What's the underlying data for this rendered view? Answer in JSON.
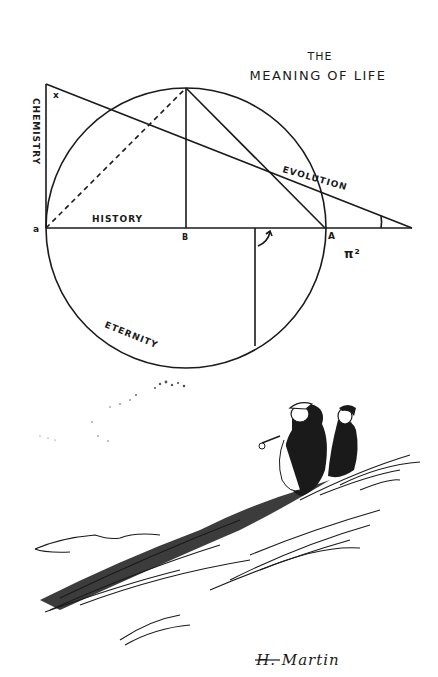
{
  "cartoon": {
    "title_line1": "THE",
    "title_line2": "MEANING OF LIFE",
    "labels": {
      "chemistry": "CHEMISTRY",
      "history": "HISTORY",
      "evolution": "EVOLUTION",
      "eternity": "ETERNITY",
      "pi_squared": "π²"
    },
    "points": {
      "x": "x",
      "a": "a",
      "b": "B",
      "A": "A"
    },
    "signature": "H. Martin",
    "scene": "Two men standing on a grassy hillside gazing up at the diagram"
  },
  "colors": {
    "ink": "#1a1a1a",
    "paper": "#ffffff"
  }
}
